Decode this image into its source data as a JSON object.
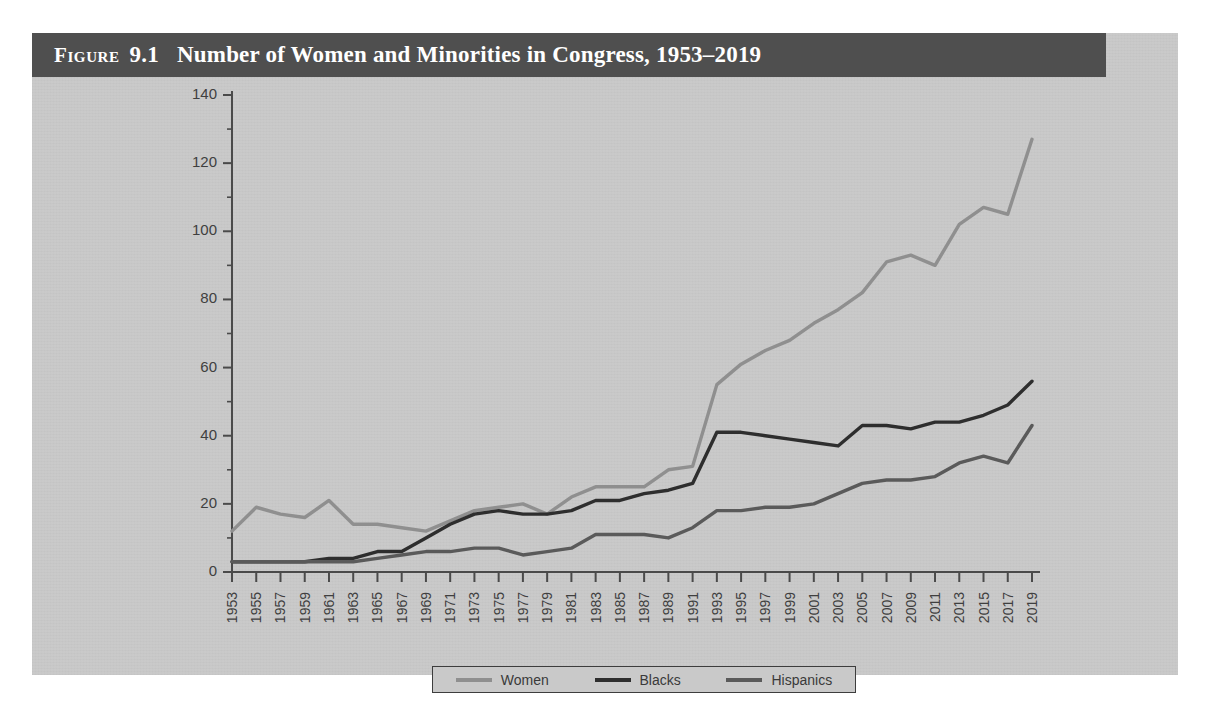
{
  "figure": {
    "label_word": "Figure",
    "number": "9.1",
    "title": "Number of Women and Minorities in Congress, 1953–2019",
    "header_bg": "#4f4f4f",
    "body_bg": "#c9c9c9"
  },
  "legend": {
    "position": "bottom-center",
    "items": [
      {
        "label": "Women",
        "color": "#8f8f8f"
      },
      {
        "label": "Blacks",
        "color": "#2e2e2e"
      },
      {
        "label": "Hispanics",
        "color": "#5a5a5a"
      }
    ]
  },
  "axes": {
    "y_ticks": [
      "0",
      "20",
      "40",
      "60",
      "80",
      "100",
      "120",
      "140"
    ],
    "ylim": [
      0,
      140
    ],
    "x_ticks": [
      "1953",
      "1955",
      "1957",
      "1959",
      "1961",
      "1963",
      "1965",
      "1967",
      "1969",
      "1971",
      "1973",
      "1975",
      "1977",
      "1979",
      "1981",
      "1983",
      "1985",
      "1987",
      "1989",
      "1991",
      "1993",
      "1995",
      "1997",
      "1999",
      "2001",
      "2003",
      "2005",
      "2007",
      "2009",
      "2011",
      "2013",
      "2015",
      "2017",
      "2019"
    ]
  },
  "chart_data": {
    "type": "line",
    "title": "Number of Women and Minorities in Congress, 1953–2019",
    "xlabel": "",
    "ylabel": "",
    "ylim": [
      0,
      140
    ],
    "grid": false,
    "legend_position": "bottom-center",
    "x": [
      1953,
      1955,
      1957,
      1959,
      1961,
      1963,
      1965,
      1967,
      1969,
      1971,
      1973,
      1975,
      1977,
      1979,
      1981,
      1983,
      1985,
      1987,
      1989,
      1991,
      1993,
      1995,
      1997,
      1999,
      2001,
      2003,
      2005,
      2007,
      2009,
      2011,
      2013,
      2015,
      2017,
      2019
    ],
    "series": [
      {
        "name": "Women",
        "color": "#8f8f8f",
        "values": [
          12,
          19,
          17,
          16,
          21,
          14,
          14,
          13,
          12,
          15,
          18,
          19,
          20,
          17,
          22,
          25,
          25,
          25,
          30,
          31,
          55,
          61,
          65,
          68,
          73,
          77,
          82,
          91,
          93,
          90,
          102,
          107,
          105,
          127
        ]
      },
      {
        "name": "Blacks",
        "color": "#2e2e2e",
        "values": [
          3,
          3,
          3,
          3,
          4,
          4,
          6,
          6,
          10,
          14,
          17,
          18,
          17,
          17,
          18,
          21,
          21,
          23,
          24,
          26,
          41,
          41,
          40,
          39,
          38,
          37,
          43,
          43,
          42,
          44,
          44,
          46,
          49,
          56
        ]
      },
      {
        "name": "Hispanics",
        "color": "#5a5a5a",
        "values": [
          3,
          3,
          3,
          3,
          3,
          3,
          4,
          5,
          6,
          6,
          7,
          7,
          5,
          6,
          7,
          11,
          11,
          11,
          10,
          13,
          18,
          18,
          19,
          19,
          20,
          23,
          26,
          27,
          27,
          28,
          32,
          34,
          32,
          43
        ]
      }
    ]
  }
}
